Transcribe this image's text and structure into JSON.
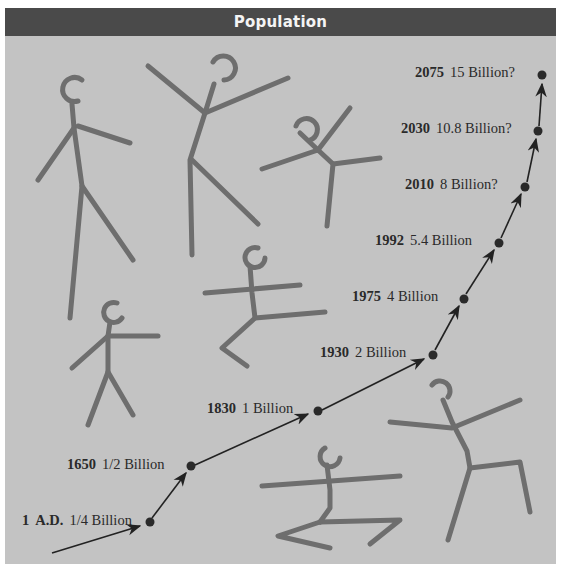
{
  "title": "Population",
  "colors": {
    "background": "#c3c3c3",
    "title_bar": "#4a4a4a",
    "title_text": "#f4f4f4",
    "figure_stroke": "#6e6e6e",
    "timeline": "#222222"
  },
  "timeline": [
    {
      "year": "1",
      "era": "A.D.",
      "value": "1/4 Billion",
      "x": 150,
      "y": 522
    },
    {
      "year": "1650",
      "value": "1/2 Billion",
      "x": 191,
      "y": 466
    },
    {
      "year": "1830",
      "value": "1 Billion",
      "x": 318,
      "y": 411
    },
    {
      "year": "1930",
      "value": "2 Billion",
      "x": 433,
      "y": 355
    },
    {
      "year": "1975",
      "value": "4 Billion",
      "x": 464,
      "y": 299
    },
    {
      "year": "1992",
      "value": "5.4 Billion",
      "x": 499,
      "y": 243
    },
    {
      "year": "2010",
      "value": "8 Billion?",
      "x": 525,
      "y": 187
    },
    {
      "year": "2030",
      "value": "10.8 Billion?",
      "x": 538,
      "y": 131
    },
    {
      "year": "2075",
      "value": "15 Billion?",
      "x": 542,
      "y": 75
    }
  ]
}
